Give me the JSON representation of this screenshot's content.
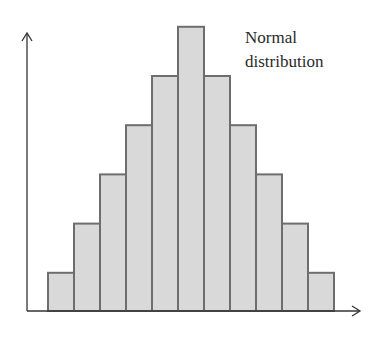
{
  "chart_data": {
    "type": "bar",
    "title": "",
    "annotation": "Normal distribution",
    "annotation_lines": [
      "Normal",
      "distribution"
    ],
    "categories": [
      "1",
      "2",
      "3",
      "4",
      "5",
      "6",
      "7",
      "8",
      "9",
      "10",
      "11"
    ],
    "values": [
      1,
      2,
      3,
      4,
      5,
      6,
      5,
      4,
      3,
      2,
      1
    ],
    "xlabel": "",
    "ylabel": "",
    "ylim": [
      0,
      6.6
    ],
    "grid": false,
    "axis_ticks": false,
    "colors": {
      "bar_fill": "#d9d9d9",
      "bar_stroke": "#6e6e6e",
      "axis": "#333333"
    }
  }
}
